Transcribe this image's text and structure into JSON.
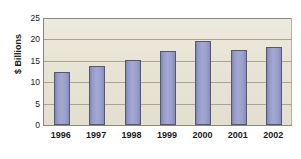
{
  "chart_data": {
    "type": "bar",
    "title": "",
    "xlabel": "",
    "ylabel": "$ Billions",
    "categories": [
      "1996",
      "1997",
      "1998",
      "1999",
      "2000",
      "2001",
      "2002"
    ],
    "values": [
      12.4,
      13.8,
      15.3,
      17.4,
      19.6,
      17.5,
      18.2
    ],
    "ylim": [
      0,
      25
    ],
    "yticks": [
      0,
      5,
      10,
      15,
      20,
      25
    ],
    "ytick_labels": [
      "0",
      "5",
      "10",
      "15",
      "20",
      "25"
    ],
    "grid": true,
    "legend": "none",
    "series": [
      {
        "name": "$ Billions",
        "values": [
          12.4,
          13.8,
          15.3,
          17.4,
          19.6,
          17.5,
          18.2
        ]
      }
    ]
  },
  "style": {
    "bar_color": "#9aa0cc",
    "bar_border_color": "#56586f",
    "plot_background": "#e9e5d6",
    "gridline_color": "#a9a492",
    "axis_color": "#8a8574",
    "text_color": "#1a1a1a",
    "page_background": "#ffffff"
  }
}
